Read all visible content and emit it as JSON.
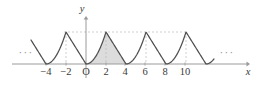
{
  "figure": {
    "kind": "math-plot",
    "background_color": "#ffffff",
    "curve_color": "#4f4f4f",
    "axis_color": "#9a9a9a",
    "dash_color": "#b9b9b9",
    "shade_fill": "#dcdcdc",
    "text_color": "#3a3a3a"
  },
  "axes": {
    "x_label": "x",
    "y_label": "y",
    "x_ticks": [
      {
        "value": -4,
        "label": "−4",
        "px": 46
      },
      {
        "value": -2,
        "label": "−2",
        "px": 66
      },
      {
        "value": 0,
        "label": "O",
        "px": 86
      },
      {
        "value": 2,
        "label": "2",
        "px": 106
      },
      {
        "value": 4,
        "label": "4",
        "px": 125
      },
      {
        "value": 6,
        "label": "6",
        "px": 145
      },
      {
        "value": 8,
        "label": "8",
        "px": 165
      },
      {
        "value": 10,
        "label": "10",
        "px": 185
      }
    ],
    "tick_label_y_px": 67,
    "baseline_y_px": 64,
    "peak_y_px": 32,
    "x_axis_start_px": 12,
    "x_axis_end_px": 250,
    "y_axis_top_px": 16,
    "y_axis_bottom_px": 78,
    "x_axis_label_px": 248,
    "x_axis_label_y_px": 67,
    "y_axis_label_px": 82,
    "y_axis_label_y_px": 4
  },
  "ellipses": {
    "glyph": "···",
    "left_px": 26,
    "right_px": 227,
    "y_px": 52
  },
  "chart_data": {
    "type": "line",
    "title": "",
    "xlabel": "x",
    "ylabel": "y",
    "grid": false,
    "legend": null,
    "xlim": [
      -5.5,
      12.8
    ],
    "ylim": [
      0,
      1.25
    ],
    "period": 4,
    "peak_value": 1,
    "zero_x_values": [
      -4,
      0,
      4,
      8,
      12
    ],
    "peak_x_values": [
      -2,
      2,
      6,
      10
    ],
    "curve_description": "periodic concave-up arcs rising from zero at even multiples of 4 to sharp peaks of height 1 at x = -2, 2, 6, 10",
    "shaded_region": {
      "x_start": 0,
      "x_end": 4,
      "label": ""
    },
    "dashed_horizontal_level": 1,
    "dashed_verticals_at": [
      -2,
      2,
      6,
      10
    ],
    "series": [
      {
        "name": "f(x)",
        "x": [
          -4.6,
          -4,
          -3.5,
          -3,
          -2.5,
          -2,
          -1.5,
          -1,
          -0.5,
          0,
          0.5,
          1,
          1.5,
          2,
          2.5,
          3,
          3.5,
          4,
          4.5,
          5,
          5.5,
          6,
          6.5,
          7,
          7.5,
          8,
          8.5,
          9,
          9.5,
          10,
          10.5,
          11,
          11.5,
          12
        ],
        "y": [
          0.09,
          0,
          0.06,
          0.25,
          0.56,
          1.0,
          0.75,
          0.5,
          0.25,
          0,
          0.06,
          0.25,
          0.56,
          1.0,
          0.75,
          0.5,
          0.25,
          0,
          0.06,
          0.25,
          0.56,
          1.0,
          0.75,
          0.5,
          0.25,
          0,
          0.06,
          0.25,
          0.56,
          1.0,
          0.75,
          0.5,
          0.25,
          0
        ]
      }
    ]
  }
}
